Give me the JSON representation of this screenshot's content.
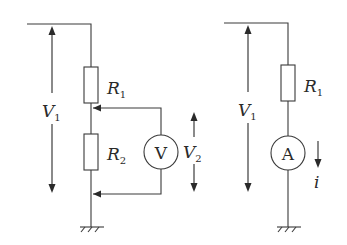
{
  "diagram": {
    "left_circuit": {
      "name": "voltage divider with voltmeter",
      "source_voltage": {
        "symbol": "V",
        "subscript": "1"
      },
      "resistors": [
        {
          "symbol": "R",
          "subscript": "1"
        },
        {
          "symbol": "R",
          "subscript": "2"
        }
      ],
      "meter": {
        "type": "voltmeter",
        "glyph": "V"
      },
      "measured_voltage": {
        "symbol": "V",
        "subscript": "2"
      },
      "ground": "ground-icon"
    },
    "right_circuit": {
      "name": "series resistor with ammeter",
      "source_voltage": {
        "symbol": "V",
        "subscript": "1"
      },
      "resistors": [
        {
          "symbol": "R",
          "subscript": "1"
        }
      ],
      "meter": {
        "type": "ammeter",
        "glyph": "A"
      },
      "current": {
        "symbol": "i"
      },
      "ground": "ground-icon"
    },
    "colors": {
      "line": "#3a3a3a",
      "text": "#2a2a2a",
      "background": "#ffffff"
    }
  }
}
